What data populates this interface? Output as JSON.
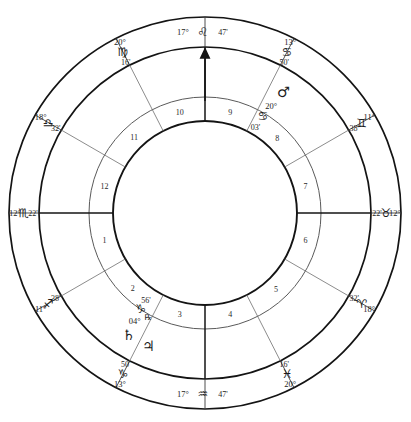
{
  "chart_data": {
    "type": "wheel",
    "subtitle": "",
    "grid": false,
    "legend_position": "none",
    "rings": {
      "outer_radius": 196,
      "zodiac_band_inner_radius": 166,
      "house_band_outer_radius": 116,
      "house_band_inner_radius": 92,
      "center_x": 205,
      "center_y": 213
    },
    "axis_markers": [
      {
        "name": "ascendant_marker",
        "label": "arrow",
        "angle_deg": 90
      }
    ],
    "cusps": [
      {
        "house": 1,
        "degree": "12",
        "sign": "scorpio",
        "glyph": "♏",
        "minute": "22'",
        "angle_deg": 180,
        "major": true,
        "label_side": "left"
      },
      {
        "house": 2,
        "degree": "11",
        "sign": "sagittarius",
        "glyph": "♐",
        "minute": "38'",
        "angle_deg": 210,
        "major": false,
        "label_side": "left"
      },
      {
        "house": 3,
        "degree": "13",
        "sign": "capricorn",
        "glyph": "♑",
        "minute": "50'",
        "angle_deg": 243,
        "major": false,
        "label_side": "left"
      },
      {
        "house": 4,
        "degree": "17",
        "sign": "aquarius",
        "glyph": "♒",
        "minute": "47'",
        "angle_deg": 270,
        "major": true,
        "label_side": "bottom"
      },
      {
        "house": 5,
        "degree": "20",
        "sign": "pisces",
        "glyph": "♓",
        "minute": "16'",
        "angle_deg": 297,
        "major": false,
        "label_side": "right"
      },
      {
        "house": 6,
        "degree": "18",
        "sign": "aries",
        "glyph": "♈",
        "minute": "32'",
        "angle_deg": 330,
        "major": false,
        "label_side": "right"
      },
      {
        "house": 7,
        "degree": "12",
        "sign": "taurus",
        "glyph": "♉",
        "minute": "22'",
        "angle_deg": 0,
        "major": true,
        "label_side": "right"
      },
      {
        "house": 8,
        "degree": "11",
        "sign": "gemini",
        "glyph": "♊",
        "minute": "38'",
        "angle_deg": 30,
        "major": false,
        "label_side": "right"
      },
      {
        "house": 9,
        "degree": "13",
        "sign": "cancer",
        "glyph": "♋",
        "minute": "50'",
        "angle_deg": 63,
        "major": false,
        "label_side": "right"
      },
      {
        "house": 10,
        "degree": "17",
        "sign": "leo",
        "glyph": "♌",
        "minute": "47'",
        "angle_deg": 90,
        "major": true,
        "label_side": "top"
      },
      {
        "house": 11,
        "degree": "20",
        "sign": "virgo",
        "glyph": "♍",
        "minute": "16'",
        "angle_deg": 117,
        "major": false,
        "label_side": "left"
      },
      {
        "house": 12,
        "degree": "18",
        "sign": "libra",
        "glyph": "♎",
        "minute": "32'",
        "angle_deg": 150,
        "major": false,
        "label_side": "left"
      }
    ],
    "house_numbers": [
      {
        "number": "1",
        "angle_deg": 195
      },
      {
        "number": "2",
        "angle_deg": 226
      },
      {
        "number": "3",
        "angle_deg": 256
      },
      {
        "number": "4",
        "angle_deg": 284
      },
      {
        "number": "5",
        "angle_deg": 313
      },
      {
        "number": "6",
        "angle_deg": 345
      },
      {
        "number": "7",
        "angle_deg": 15
      },
      {
        "number": "8",
        "angle_deg": 46
      },
      {
        "number": "9",
        "angle_deg": 76
      },
      {
        "number": "10",
        "angle_deg": 104
      },
      {
        "number": "11",
        "angle_deg": 133
      },
      {
        "number": "12",
        "angle_deg": 165
      }
    ],
    "planets": [
      {
        "name": "mars",
        "glyph": "♂",
        "degree": "20°",
        "sign": "cancer",
        "sign_glyph": "♋",
        "minute": "03'",
        "retrograde": false,
        "retro_glyph": "",
        "angle_deg": 57
      },
      {
        "name": "saturn",
        "glyph": "♄",
        "degree": "04°",
        "sign": "capricorn",
        "sign_glyph": "♑",
        "minute": "56'",
        "retrograde": true,
        "retro_glyph": "℞",
        "angle_deg": 238
      },
      {
        "name": "jupiter",
        "glyph": "♃",
        "degree": "",
        "sign": "capricorn",
        "sign_glyph": "♑",
        "minute": "",
        "retrograde": false,
        "retro_glyph": "",
        "angle_deg": 247
      }
    ]
  },
  "colors": {
    "ink": "#141414",
    "ink_light": "#6e6e6e",
    "background": "#ffffff"
  }
}
